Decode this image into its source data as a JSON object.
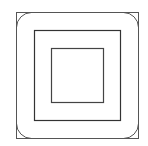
{
  "diagram": {
    "title": "",
    "stroke_color": "#555555",
    "background": "#ffffff",
    "shapes": [
      {
        "name": "outer-square",
        "x": 16,
        "y": 12,
        "w": 122,
        "h": 126,
        "radius": 0
      },
      {
        "name": "outer-rounded-square",
        "x": 16,
        "y": 12,
        "w": 122,
        "h": 126,
        "radius": 15
      },
      {
        "name": "middle-square",
        "x": 34,
        "y": 30,
        "w": 86,
        "h": 90,
        "radius": 0
      },
      {
        "name": "inner-square",
        "x": 51,
        "y": 48,
        "w": 52,
        "h": 54,
        "radius": 0
      }
    ]
  }
}
